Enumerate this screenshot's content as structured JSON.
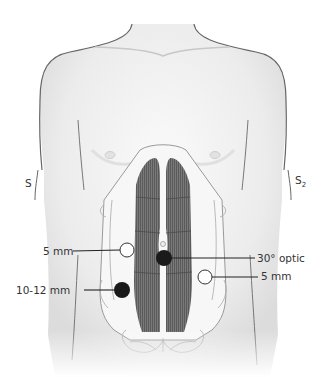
{
  "figure": {
    "side_markers": {
      "left": "S",
      "right": "S",
      "right_subscript": "2"
    },
    "ports": [
      {
        "id": "left-upper",
        "label": "5 mm",
        "style": "open",
        "cx": 127,
        "cy": 250
      },
      {
        "id": "umbilical",
        "label": "30° optic",
        "style": "filled",
        "cx": 164,
        "cy": 258
      },
      {
        "id": "right-lower",
        "label": "5 mm",
        "style": "open",
        "cx": 205,
        "cy": 277
      },
      {
        "id": "left-lower",
        "label": "10-12 mm",
        "style": "filled",
        "cx": 122,
        "cy": 290
      }
    ],
    "colors": {
      "skin": "#f2f2f2",
      "outline": "#6b6b6b",
      "muscle": "#6e6e6e",
      "port_filled": "#1a1a1a",
      "port_open": "#ffffff",
      "leader": "#222222"
    }
  }
}
